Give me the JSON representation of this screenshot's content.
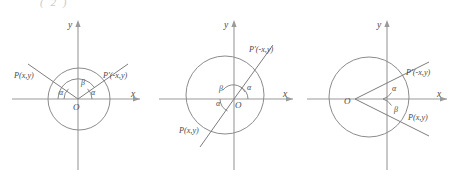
{
  "figure": {
    "cut_fragment": "(  2  )",
    "panels": [
      {
        "id": "panel-symmetry-about-y-axis",
        "axis_x_label": "x",
        "axis_y_label": "y",
        "origin_label": "O",
        "point_left_label": "P(x,y)",
        "point_right_label": "P'(-x,y)",
        "angle_alpha_left_label": "α",
        "angle_alpha_right_label": "α",
        "angle_beta_label": "β"
      },
      {
        "id": "panel-symmetry-through-origin",
        "axis_x_label": "x",
        "axis_y_label": "y",
        "origin_label": "O",
        "point_left_label": "P(x,y)",
        "point_right_label": "P'(-x,y)",
        "angle_alpha_left_label": "α",
        "angle_alpha_right_label": "α",
        "angle_beta_label": "β"
      },
      {
        "id": "panel-symmetry-about-x-axis",
        "axis_x_label": "x",
        "axis_y_label": "y",
        "origin_label": "O",
        "point_left_label": "P(x,y)",
        "point_right_label": "P'(-x,y)",
        "angle_alpha_right_label": "α",
        "angle_beta_label": "β"
      }
    ],
    "colors": {
      "background": "#ffffff",
      "axis": "#9a9a9a",
      "curve": "#8c8c8c",
      "ray": "#7d7d7d",
      "text": "#4a4a4a",
      "faint_text": "#c9c9c9"
    }
  }
}
